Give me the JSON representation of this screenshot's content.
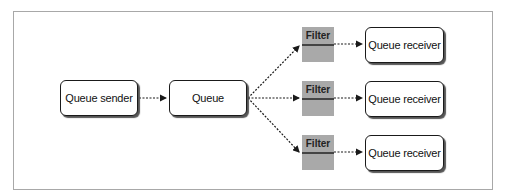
{
  "diagram": {
    "sender": {
      "label": "Queue sender"
    },
    "queue": {
      "label": "Queue"
    },
    "branches": [
      {
        "filter": "Filter",
        "receiver": "Queue receiver"
      },
      {
        "filter": "Filter",
        "receiver": "Queue receiver"
      },
      {
        "filter": "Filter",
        "receiver": "Queue receiver"
      }
    ],
    "colors": {
      "border": "#1a1a1a",
      "filter_fill": "#a9a9a9",
      "frame": "#a8a8a8"
    }
  }
}
